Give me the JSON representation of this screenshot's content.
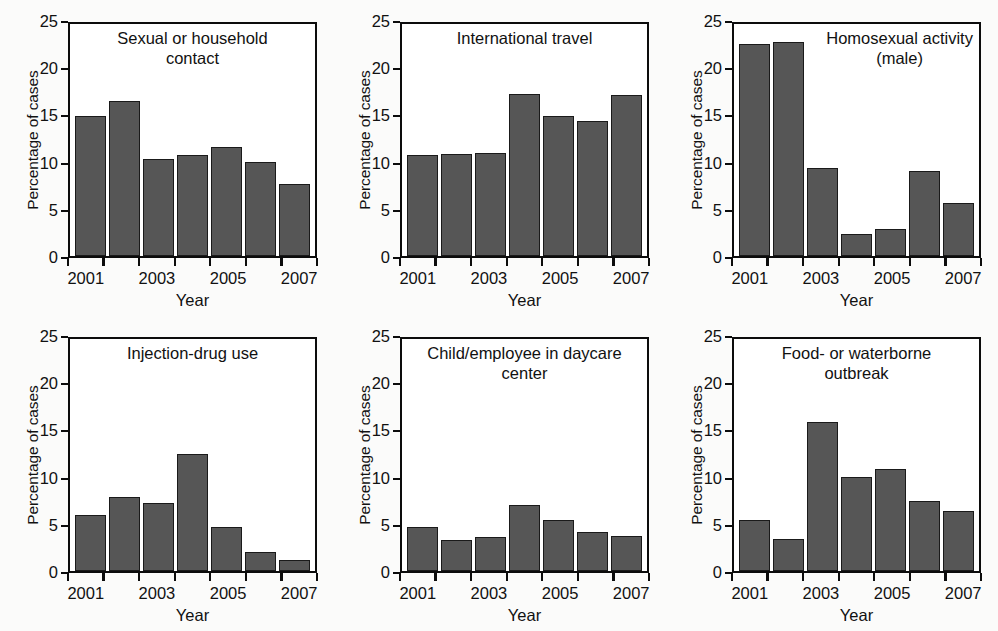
{
  "figure": {
    "shared_ylabel": "Percentage of cases",
    "shared_xlabel": "Year",
    "y_ticks": [
      "0",
      "5",
      "10",
      "15",
      "20",
      "25"
    ],
    "x_tick_labels": [
      "2001",
      "2003",
      "2005",
      "2007"
    ],
    "bar_color": "#565656",
    "axis_color": "#0c0c0c",
    "background_color": "#fbfbfa"
  },
  "chart_data": [
    {
      "type": "bar",
      "title": "Sexual or household\ncontact",
      "categories": [
        "2001",
        "2002",
        "2003",
        "2004",
        "2005",
        "2006",
        "2007"
      ],
      "values": [
        15.1,
        16.7,
        10.5,
        10.9,
        11.8,
        10.1,
        7.8
      ],
      "xlabel": "Year",
      "ylabel": "Percentage of cases",
      "ylim": [
        0,
        25
      ],
      "yticks": [
        0,
        5,
        10,
        15,
        20,
        25
      ],
      "xtick_labels": [
        "2001",
        "2003",
        "2005",
        "2007"
      ],
      "grid": false,
      "legend": false
    },
    {
      "type": "bar",
      "title": "International travel",
      "categories": [
        "2001",
        "2002",
        "2003",
        "2004",
        "2005",
        "2006",
        "2007"
      ],
      "values": [
        10.9,
        11.0,
        11.1,
        17.5,
        15.1,
        14.6,
        17.4
      ],
      "xlabel": "Year",
      "ylabel": "Percentage of cases",
      "ylim": [
        0,
        25
      ],
      "yticks": [
        0,
        5,
        10,
        15,
        20,
        25
      ],
      "xtick_labels": [
        "2001",
        "2003",
        "2005",
        "2007"
      ],
      "grid": false,
      "legend": false
    },
    {
      "type": "bar",
      "title": "Homosexual activity\n(male)",
      "categories": [
        "2001",
        "2002",
        "2003",
        "2004",
        "2005",
        "2006",
        "2007"
      ],
      "values": [
        22.9,
        23.1,
        9.5,
        2.4,
        2.9,
        9.2,
        5.7
      ],
      "xlabel": "Year",
      "ylabel": "Percentage of cases",
      "ylim": [
        0,
        25
      ],
      "yticks": [
        0,
        5,
        10,
        15,
        20,
        25
      ],
      "xtick_labels": [
        "2001",
        "2003",
        "2005",
        "2007"
      ],
      "grid": false,
      "legend": false
    },
    {
      "type": "bar",
      "title": "Injection-drug use",
      "categories": [
        "2001",
        "2002",
        "2003",
        "2004",
        "2005",
        "2006",
        "2007"
      ],
      "values": [
        6.1,
        8.0,
        7.3,
        12.6,
        4.8,
        2.1,
        1.2
      ],
      "xlabel": "Year",
      "ylabel": "Percentage of cases",
      "ylim": [
        0,
        25
      ],
      "yticks": [
        0,
        5,
        10,
        15,
        20,
        25
      ],
      "xtick_labels": [
        "2001",
        "2003",
        "2005",
        "2007"
      ],
      "grid": false,
      "legend": false
    },
    {
      "type": "bar",
      "title": "Child/employee in daycare\ncenter",
      "categories": [
        "2001",
        "2002",
        "2003",
        "2004",
        "2005",
        "2006",
        "2007"
      ],
      "values": [
        4.7,
        3.4,
        3.7,
        7.1,
        5.5,
        4.2,
        3.8
      ],
      "xlabel": "Year",
      "ylabel": "Percentage of cases",
      "ylim": [
        0,
        25
      ],
      "yticks": [
        0,
        5,
        10,
        15,
        20,
        25
      ],
      "xtick_labels": [
        "2001",
        "2003",
        "2005",
        "2007"
      ],
      "grid": false,
      "legend": false
    },
    {
      "type": "bar",
      "title": "Food- or waterborne\noutbreak",
      "categories": [
        "2001",
        "2002",
        "2003",
        "2004",
        "2005",
        "2006",
        "2007"
      ],
      "values": [
        5.5,
        3.5,
        16.1,
        10.2,
        11.0,
        7.6,
        6.5
      ],
      "xlabel": "Year",
      "ylabel": "Percentage of cases",
      "ylim": [
        0,
        25
      ],
      "yticks": [
        0,
        5,
        10,
        15,
        20,
        25
      ],
      "xtick_labels": [
        "2001",
        "2003",
        "2005",
        "2007"
      ],
      "grid": false,
      "legend": false
    }
  ]
}
